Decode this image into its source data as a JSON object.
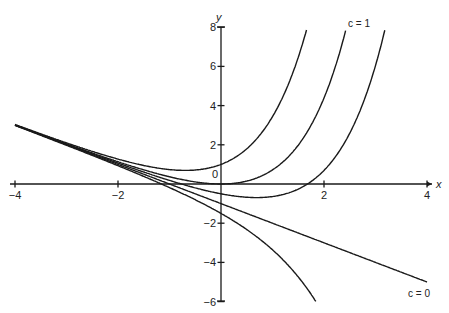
{
  "chart_data": {
    "type": "line",
    "title": "",
    "xlabel": "x",
    "ylabel": "y",
    "xlim": [
      -4,
      4
    ],
    "ylim": [
      -6,
      8
    ],
    "grid": false,
    "x_ticks": [
      -4,
      -2,
      2,
      4
    ],
    "y_ticks": [
      -6,
      -4,
      -2,
      0,
      2,
      4,
      6,
      8
    ],
    "x_tick_labels": [
      "−4",
      "−2",
      "2",
      "4"
    ],
    "y_tick_labels": [
      "−6",
      "−4",
      "−2",
      "0",
      "2",
      "4",
      "6",
      "8"
    ],
    "formula": "y = c·e^x − x − 1",
    "series": [
      {
        "name": "c = 2",
        "c": 2,
        "label_visible": false
      },
      {
        "name": "c = 1",
        "c": 1,
        "label_visible": true
      },
      {
        "name": "c = 0.5",
        "c": 0.5,
        "label_visible": false
      },
      {
        "name": "c = 0",
        "c": 0,
        "label_visible": true
      },
      {
        "name": "c = -0.5",
        "c": -0.5,
        "label_visible": false
      }
    ],
    "annotations": [
      {
        "text": "c = 1",
        "x": 2.55,
        "y": 8.0
      },
      {
        "text": "c = 0",
        "x": 3.6,
        "y": -5.6
      }
    ]
  },
  "labels": {
    "x_axis": "x",
    "y_axis": "y",
    "c1": "c = 1",
    "c0": "c = 0",
    "origin": "0"
  }
}
